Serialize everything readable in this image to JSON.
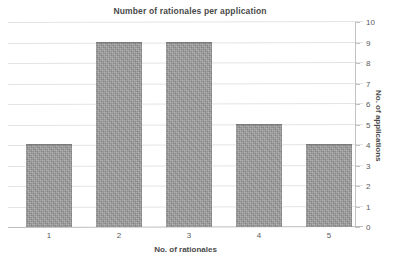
{
  "chart_data": {
    "type": "bar",
    "title": "Number of rationales per application",
    "xlabel": "No. of rationales",
    "ylabel": "No. of applications",
    "categories": [
      "1",
      "2",
      "3",
      "4",
      "5"
    ],
    "values": [
      4,
      9,
      9,
      5,
      4
    ],
    "ylim": [
      0,
      10
    ],
    "yticks": [
      "0",
      "1",
      "2",
      "3",
      "4",
      "5",
      "6",
      "7",
      "8",
      "9",
      "10"
    ],
    "grid": true,
    "legend": null,
    "legend_position": "none",
    "y_axis_side": "right",
    "bar_color": "#8a8a8a",
    "gridline_color": "#e3e3e3",
    "axis_color": "#c2c2c2",
    "text_color": "#4a4a4a"
  }
}
